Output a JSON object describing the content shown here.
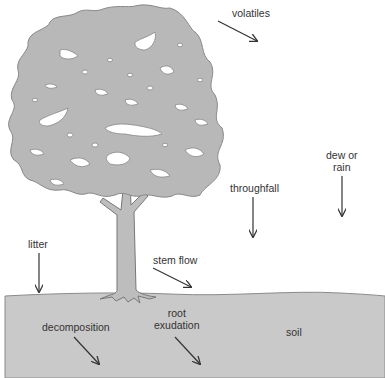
{
  "diagram": {
    "type": "illustration",
    "colors": {
      "canopy": "#b8b8b8",
      "trunk": "#bdbdbd",
      "soil": "#c8c8c8",
      "outline": "#777777",
      "arrow": "#333333",
      "text": "#333333"
    },
    "labels": {
      "volatiles": "volatiles",
      "dew_or_rain_line1": "dew or",
      "dew_or_rain_line2": "rain",
      "throughfall": "throughfall",
      "litter": "litter",
      "stem_flow": "stem flow",
      "decomposition": "decomposition",
      "root_exudation_line1": "root",
      "root_exudation_line2": "exudation",
      "soil": "soil"
    }
  }
}
